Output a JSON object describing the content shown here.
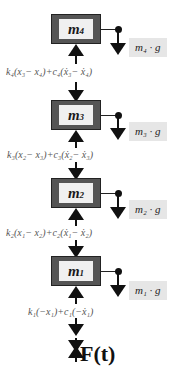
{
  "diagram": {
    "type": "free-body diagram of 4-mass spring-damper chain",
    "masses": [
      {
        "id": "m4",
        "label": "m",
        "sub": "4",
        "weight_label": "m₄ · g"
      },
      {
        "id": "m3",
        "label": "m",
        "sub": "3",
        "weight_label": "m₃ · g"
      },
      {
        "id": "m2",
        "label": "m",
        "sub": "2",
        "weight_label": "m₂ · g"
      },
      {
        "id": "m1",
        "label": "m",
        "sub": "1",
        "weight_label": "m₁ · g"
      }
    ],
    "forces": [
      {
        "between": "m4-m3",
        "text": "k₄(x₃− x₄)+c₄(ẋ₃− ẋ₄)"
      },
      {
        "between": "m3-m2",
        "text": "k₃(x₂− x₃)+c₃(ẋ₂− ẋ₃)"
      },
      {
        "between": "m2-m1",
        "text": "k₂(x₁− x₂)+c₂(ẋ₁− ẋ₂)"
      },
      {
        "between": "m1-ground",
        "text": "k₁(−x₁)+c₁(−ẋ₁)"
      }
    ],
    "input_force": "F(t)"
  },
  "colors": {
    "block_frame": "#555555",
    "block_fill": "#f0f0f0",
    "weight_label_bg": "#e6e6e6",
    "force_text": "#555555"
  }
}
